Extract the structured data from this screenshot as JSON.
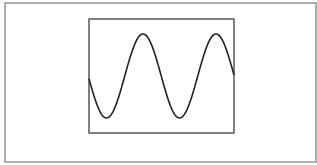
{
  "figure": {
    "colors": {
      "background": "#ffffff",
      "outer_border": "#7a7a7a",
      "inner_frame": "#4a4a4a",
      "curve": "#222222"
    },
    "outer_box": {
      "x": 5,
      "y": 3,
      "width": 311,
      "height": 159
    },
    "inner_box": {
      "x": 89,
      "y": 19,
      "width": 145,
      "height": 114
    },
    "wave": {
      "type": "sine",
      "x_start": 89,
      "x_end": 234,
      "center_y": 76,
      "amplitude": 42,
      "period": 73,
      "peak_x": 143,
      "peaks": [
        [
          143,
          34
        ],
        [
          216,
          34
        ]
      ],
      "troughs": [
        [
          107,
          118
        ],
        [
          179,
          118
        ]
      ]
    }
  }
}
